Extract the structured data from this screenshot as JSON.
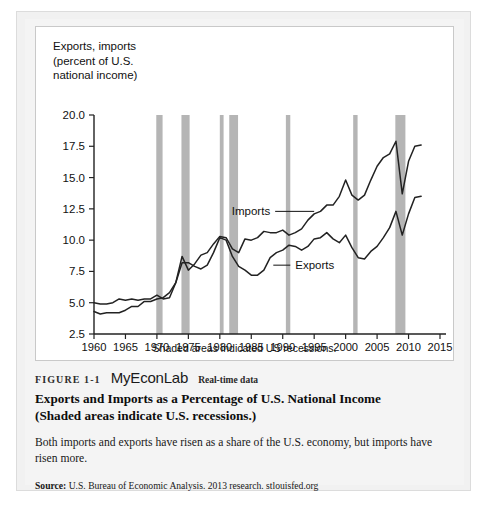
{
  "figure": {
    "number_label": "FIGURE 1-1",
    "brand": "MyEconLab",
    "brand_tag": "Real-time data",
    "title_line1": "Exports and Imports as a Percentage of U.S. National Income",
    "title_line2": "(Shaded areas indicate U.S. recessions.)",
    "body": "Both imports and exports have risen as a share of the U.S. economy, but imports have risen more.",
    "source_label": "Source:",
    "source_text": "U.S. Bureau of Economic Analysis. 2013 research. stlouisfed.org"
  },
  "chart_data": {
    "type": "line",
    "title": "",
    "axis_title": "Exports, imports\n(percent of U.S.\nnational income)",
    "xlabel": "",
    "ylabel": "",
    "x_caption": "Shaded areas indicated US recessions.",
    "xlim": [
      1960,
      2015
    ],
    "ylim": [
      2.5,
      20.0
    ],
    "xticks": [
      1960,
      1965,
      1970,
      1975,
      1980,
      1985,
      1990,
      1995,
      2000,
      2005,
      2010,
      2015
    ],
    "yticks": [
      2.5,
      5.0,
      7.5,
      10.0,
      12.5,
      15.0,
      17.5,
      20.0
    ],
    "ytick_labels": [
      "2.5",
      "5.0",
      "7.5",
      "10.0",
      "12.5",
      "15.0",
      "17.5",
      "20.0"
    ],
    "grid": false,
    "legend_position": "inline-annotations",
    "colors": {
      "line": "#222222",
      "recession_band": "#b5b5b5",
      "plot_background": "#ffffff",
      "page_background": "#f2f2f2",
      "axis": "#222222"
    },
    "annotations": [
      {
        "label": "Imports",
        "x": 1988.0,
        "y": 12.3,
        "leader_to_x": 1995.0,
        "leader_to_y": 12.3
      },
      {
        "label": "Exports",
        "x": 1992.0,
        "y": 8.0,
        "leader_to_x": 1988.5,
        "leader_to_y": 8.0
      }
    ],
    "recessions": [
      {
        "start": 1969.9,
        "end": 1970.9
      },
      {
        "start": 1973.9,
        "end": 1975.2
      },
      {
        "start": 1980.0,
        "end": 1980.6
      },
      {
        "start": 1981.5,
        "end": 1982.9
      },
      {
        "start": 1990.5,
        "end": 1991.2
      },
      {
        "start": 2001.2,
        "end": 2001.9
      },
      {
        "start": 2007.9,
        "end": 2009.5
      }
    ],
    "series": [
      {
        "name": "Exports",
        "x": [
          1960,
          1961,
          1962,
          1963,
          1964,
          1965,
          1966,
          1967,
          1968,
          1969,
          1970,
          1971,
          1972,
          1973,
          1974,
          1975,
          1976,
          1977,
          1978,
          1979,
          1980,
          1981,
          1982,
          1983,
          1984,
          1985,
          1986,
          1987,
          1988,
          1989,
          1990,
          1991,
          1992,
          1993,
          1994,
          1995,
          1996,
          1997,
          1998,
          1999,
          2000,
          2001,
          2002,
          2003,
          2004,
          2005,
          2006,
          2007,
          2008,
          2009,
          2010,
          2011,
          2012
        ],
        "values": [
          5.0,
          4.9,
          4.9,
          5.0,
          5.3,
          5.2,
          5.3,
          5.2,
          5.3,
          5.3,
          5.6,
          5.3,
          5.4,
          6.6,
          8.2,
          8.2,
          7.9,
          7.7,
          8.0,
          9.0,
          10.2,
          10.0,
          8.7,
          7.9,
          7.6,
          7.2,
          7.2,
          7.6,
          8.6,
          9.0,
          9.2,
          9.6,
          9.5,
          9.2,
          9.5,
          10.1,
          10.2,
          10.6,
          10.1,
          9.8,
          10.4,
          9.4,
          8.6,
          8.5,
          9.1,
          9.5,
          10.2,
          11.0,
          12.3,
          10.4,
          12.1,
          13.4,
          13.5
        ]
      },
      {
        "name": "Imports",
        "x": [
          1960,
          1961,
          1962,
          1963,
          1964,
          1965,
          1966,
          1967,
          1968,
          1969,
          1970,
          1971,
          1972,
          1973,
          1974,
          1975,
          1976,
          1977,
          1978,
          1979,
          1980,
          1981,
          1982,
          1983,
          1984,
          1985,
          1986,
          1987,
          1988,
          1989,
          1990,
          1991,
          1992,
          1993,
          1994,
          1995,
          1996,
          1997,
          1998,
          1999,
          2000,
          2001,
          2002,
          2003,
          2004,
          2005,
          2006,
          2007,
          2008,
          2009,
          2010,
          2011,
          2012
        ],
        "values": [
          4.3,
          4.1,
          4.2,
          4.2,
          4.2,
          4.4,
          4.7,
          4.7,
          5.1,
          5.1,
          5.3,
          5.4,
          5.8,
          6.6,
          8.7,
          7.6,
          8.1,
          8.8,
          9.0,
          9.7,
          10.3,
          10.2,
          9.3,
          9.0,
          10.1,
          10.0,
          10.2,
          10.7,
          10.6,
          10.6,
          10.8,
          10.4,
          10.6,
          10.9,
          11.6,
          12.1,
          12.3,
          12.8,
          12.8,
          13.5,
          14.8,
          13.6,
          13.2,
          13.6,
          14.8,
          15.9,
          16.6,
          16.9,
          17.9,
          13.7,
          16.3,
          17.5,
          17.6
        ]
      }
    ]
  }
}
